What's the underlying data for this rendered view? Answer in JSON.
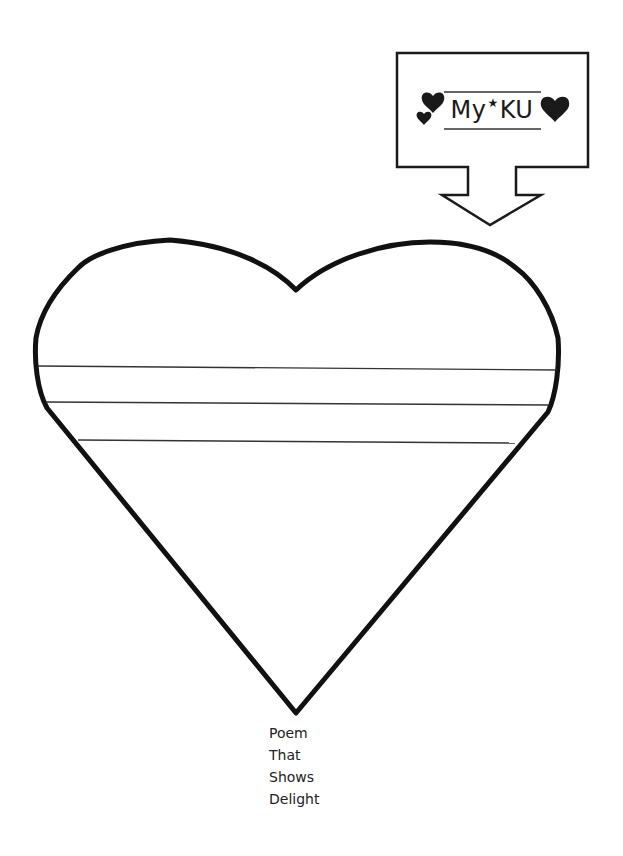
{
  "worksheet": {
    "title_box": {
      "prefix": "My",
      "star_glyph": "★",
      "suffix": "KU",
      "decorations": [
        "heart-icon-small",
        "heart-icon-medium",
        "heart-icon-large"
      ]
    },
    "heart": {
      "writing_lines_count": 3,
      "outline_color": "#111111",
      "line_color": "#333333"
    },
    "caption": {
      "lines": [
        "Poem",
        "That",
        "Shows",
        "Delight"
      ]
    }
  }
}
